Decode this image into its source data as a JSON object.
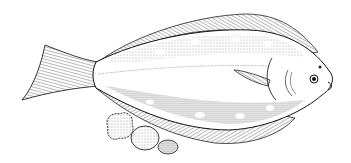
{
  "image": {
    "subject": "flatfish illustration",
    "style": "black ink stipple drawing on white",
    "colors": {
      "background": "#ffffff",
      "ink": "#1a1a1a",
      "shade": "#555555"
    }
  }
}
